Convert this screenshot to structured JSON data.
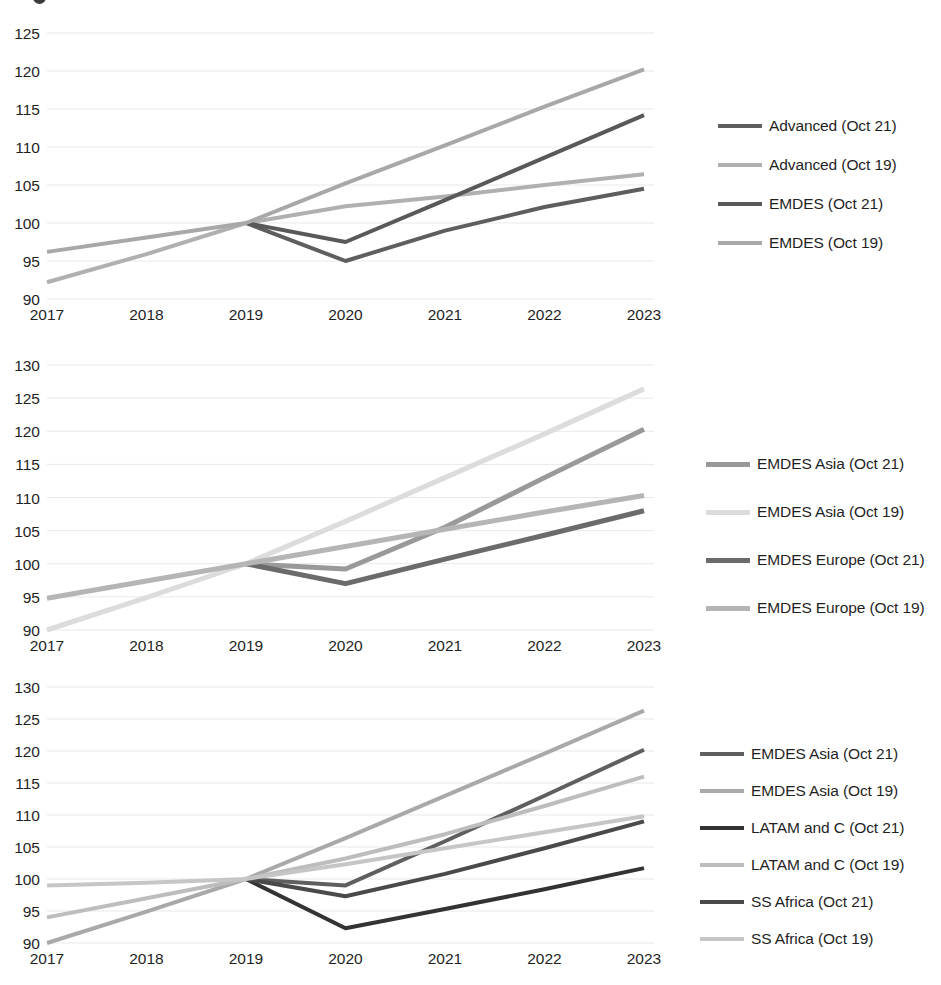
{
  "figure": {
    "background_color": "#ffffff",
    "n_panels": 3,
    "x_tick_labels": [
      "2017",
      "2018",
      "2019",
      "2020",
      "2021",
      "2022",
      "2023"
    ]
  },
  "chart_data": [
    {
      "type": "line",
      "panel_id": "panel-advanced-emdes",
      "title": "",
      "xlabel": "",
      "ylabel": "",
      "x": [
        "2017",
        "2018",
        "2019",
        "2020",
        "2021",
        "2022",
        "2023"
      ],
      "categories": [
        "2017",
        "2018",
        "2019",
        "2020",
        "2021",
        "2022",
        "2023"
      ],
      "xlim": [
        "2017",
        "2023"
      ],
      "ylim": [
        90,
        125
      ],
      "y_ticks": [
        90,
        95,
        100,
        105,
        110,
        115,
        120,
        125
      ],
      "grid": true,
      "legend_position": "right",
      "series": [
        {
          "name": "Advanced (Oct 21)",
          "color": "#5e5e5e",
          "width": 4,
          "values": [
            null,
            null,
            100.0,
            95.0,
            99.0,
            102.1,
            104.5
          ]
        },
        {
          "name": "Advanced (Oct 19)",
          "color": "#b0b0b0",
          "width": 4,
          "values": [
            92.2,
            95.9,
            100.0,
            102.2,
            103.5,
            105.0,
            106.4
          ]
        },
        {
          "name": "EMDES (Oct 21)",
          "color": "#595959",
          "width": 4,
          "values": [
            null,
            null,
            100.0,
            97.5,
            103.0,
            108.6,
            114.2
          ]
        },
        {
          "name": "EMDES (Oct 19)",
          "color": "#a8a8a8",
          "width": 4,
          "values": [
            96.2,
            98.1,
            100.0,
            105.2,
            110.2,
            115.3,
            120.2
          ]
        }
      ]
    },
    {
      "type": "line",
      "panel_id": "panel-emdes-asia-europe",
      "title": "",
      "xlabel": "",
      "ylabel": "",
      "x": [
        "2017",
        "2018",
        "2019",
        "2020",
        "2021",
        "2022",
        "2023"
      ],
      "categories": [
        "2017",
        "2018",
        "2019",
        "2020",
        "2021",
        "2022",
        "2023"
      ],
      "xlim": [
        "2017",
        "2023"
      ],
      "ylim": [
        90,
        130
      ],
      "y_ticks": [
        90,
        95,
        100,
        105,
        110,
        115,
        120,
        125,
        130
      ],
      "grid": true,
      "legend_position": "right",
      "series": [
        {
          "name": "EMDES Asia (Oct 21)",
          "color": "#999999",
          "width": 5,
          "values": [
            null,
            null,
            100.0,
            99.2,
            105.5,
            113.0,
            120.3
          ]
        },
        {
          "name": "EMDES Asia (Oct 19)",
          "color": "#dcdcdc",
          "width": 5,
          "values": [
            90.0,
            94.9,
            100.0,
            106.4,
            113.0,
            119.6,
            126.4
          ]
        },
        {
          "name": "EMDES Europe (Oct 21)",
          "color": "#6b6b6b",
          "width": 5,
          "values": [
            null,
            null,
            100.0,
            97.0,
            100.7,
            104.3,
            108.0
          ]
        },
        {
          "name": "EMDES Europe (Oct 19)",
          "color": "#b5b5b5",
          "width": 5,
          "values": [
            94.8,
            97.4,
            100.0,
            102.6,
            105.2,
            107.8,
            110.3
          ]
        }
      ]
    },
    {
      "type": "line",
      "panel_id": "panel-emdes-regions",
      "title": "",
      "xlabel": "",
      "ylabel": "",
      "x": [
        "2017",
        "2018",
        "2019",
        "2020",
        "2021",
        "2022",
        "2023"
      ],
      "categories": [
        "2017",
        "2018",
        "2019",
        "2020",
        "2021",
        "2022",
        "2023"
      ],
      "xlim": [
        "2017",
        "2023"
      ],
      "ylim": [
        90,
        130
      ],
      "y_ticks": [
        90,
        95,
        100,
        105,
        110,
        115,
        120,
        125,
        130
      ],
      "grid": true,
      "legend_position": "right",
      "series": [
        {
          "name": "EMDES Asia (Oct 21)",
          "color": "#5f5f5f",
          "width": 4,
          "values": [
            null,
            null,
            100.0,
            99.0,
            105.9,
            113.0,
            120.2
          ]
        },
        {
          "name": "EMDES Asia (Oct 19)",
          "color": "#a9a9a9",
          "width": 4,
          "values": [
            90.0,
            94.9,
            100.0,
            106.4,
            113.0,
            119.6,
            126.3
          ]
        },
        {
          "name": "LATAM and C (Oct 21)",
          "color": "#333333",
          "width": 4,
          "values": [
            null,
            null,
            100.0,
            92.3,
            95.3,
            98.4,
            101.7
          ]
        },
        {
          "name": "LATAM and C (Oct 19)",
          "color": "#bdbdbd",
          "width": 4,
          "values": [
            94.0,
            97.0,
            100.0,
            103.2,
            107.0,
            111.4,
            116.0
          ]
        },
        {
          "name": "SS Africa (Oct 21)",
          "color": "#4a4a4a",
          "width": 4,
          "values": [
            null,
            null,
            100.0,
            97.3,
            100.8,
            104.8,
            109.0
          ]
        },
        {
          "name": "SS Africa (Oct 19)",
          "color": "#c6c6c6",
          "width": 4,
          "values": [
            99.0,
            99.4,
            100.0,
            102.3,
            104.8,
            107.3,
            109.8
          ]
        }
      ]
    }
  ],
  "panel1": {
    "y_ticks": [
      "125",
      "120",
      "115",
      "110",
      "105",
      "100",
      "95",
      "90"
    ],
    "x_ticks": [
      "2017",
      "2018",
      "2019",
      "2020",
      "2021",
      "2022",
      "2023"
    ],
    "legend": [
      {
        "label": "Advanced (Oct 21)",
        "color": "#5e5e5e"
      },
      {
        "label": "Advanced (Oct 19)",
        "color": "#b0b0b0"
      },
      {
        "label": "EMDES (Oct 21)",
        "color": "#595959"
      },
      {
        "label": "EMDES (Oct 19)",
        "color": "#a8a8a8"
      }
    ]
  },
  "panel2": {
    "y_ticks": [
      "130",
      "125",
      "120",
      "115",
      "110",
      "105",
      "100",
      "95",
      "90"
    ],
    "x_ticks": [
      "2017",
      "2018",
      "2019",
      "2020",
      "2021",
      "2022",
      "2023"
    ],
    "legend": [
      {
        "label": "EMDES Asia (Oct 21)",
        "color": "#999999"
      },
      {
        "label": "EMDES Asia (Oct 19)",
        "color": "#dcdcdc"
      },
      {
        "label": "EMDES Europe (Oct 21)",
        "color": "#6b6b6b"
      },
      {
        "label": "EMDES Europe (Oct 19)",
        "color": "#b5b5b5"
      }
    ]
  },
  "panel3": {
    "y_ticks": [
      "130",
      "125",
      "120",
      "115",
      "110",
      "105",
      "100",
      "95",
      "90"
    ],
    "x_ticks": [
      "2017",
      "2018",
      "2019",
      "2020",
      "2021",
      "2022",
      "2023"
    ],
    "legend": [
      {
        "label": "EMDES Asia (Oct 21)",
        "color": "#5f5f5f"
      },
      {
        "label": "EMDES Asia (Oct 19)",
        "color": "#a9a9a9"
      },
      {
        "label": "LATAM and C (Oct 21)",
        "color": "#333333"
      },
      {
        "label": "LATAM and C (Oct 19)",
        "color": "#bdbdbd"
      },
      {
        "label": "SS Africa (Oct 21)",
        "color": "#4a4a4a"
      },
      {
        "label": "SS Africa (Oct 19)",
        "color": "#c6c6c6"
      }
    ]
  }
}
